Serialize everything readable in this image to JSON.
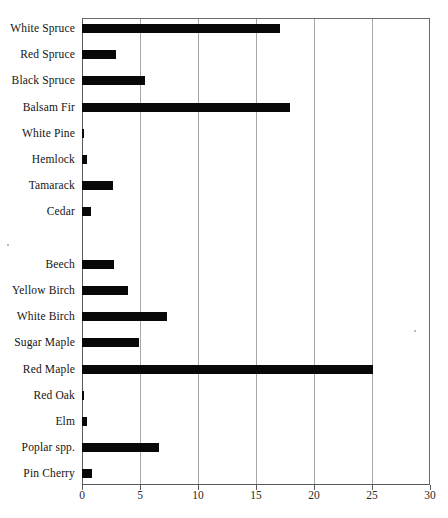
{
  "chart_data": {
    "type": "bar",
    "orientation": "horizontal",
    "title": "",
    "subtitle": "",
    "xlabel": "",
    "ylabel": "",
    "xlim": [
      0,
      30
    ],
    "ylim": null,
    "grid": "vertical gridlines at every x tick",
    "legend": "none",
    "bar_color": "#080808",
    "gridline_color": "#a6a6a6",
    "axis_color": "#5a5a5a",
    "xticks": [
      0,
      5,
      10,
      15,
      20,
      25,
      30
    ],
    "xtick_labels": [
      "0",
      "5",
      "10",
      "15",
      "20",
      "25",
      "30"
    ],
    "groups": [
      {
        "name": "conifers",
        "categories": [
          "White Spruce",
          "Red Spruce",
          "Black Spruce",
          "Balsam Fir",
          "White Pine",
          "Hemlock",
          "Tamarack",
          "Cedar"
        ],
        "values": [
          17.1,
          2.9,
          5.4,
          17.9,
          0.05,
          0.4,
          2.7,
          0.8
        ]
      },
      {
        "name": "hardwoods",
        "categories": [
          "Beech",
          "Yellow Birch",
          "White Birch",
          "Sugar Maple",
          "Red Maple",
          "Red Oak",
          "Elm",
          "Poplar spp.",
          "Pin Cherry"
        ],
        "values": [
          2.8,
          4.0,
          7.3,
          4.9,
          25.1,
          0.05,
          0.4,
          6.6,
          0.9
        ]
      }
    ],
    "categories": [
      "White Spruce",
      "Red Spruce",
      "Black Spruce",
      "Balsam Fir",
      "White Pine",
      "Hemlock",
      "Tamarack",
      "Cedar",
      "Beech",
      "Yellow Birch",
      "White Birch",
      "Sugar Maple",
      "Red Maple",
      "Red Oak",
      "Elm",
      "Poplar spp.",
      "Pin Cherry"
    ],
    "values": [
      17.1,
      2.9,
      5.4,
      17.9,
      0.05,
      0.4,
      2.7,
      0.8,
      2.8,
      4.0,
      7.3,
      4.9,
      25.1,
      0.05,
      0.4,
      6.6,
      0.9
    ]
  }
}
